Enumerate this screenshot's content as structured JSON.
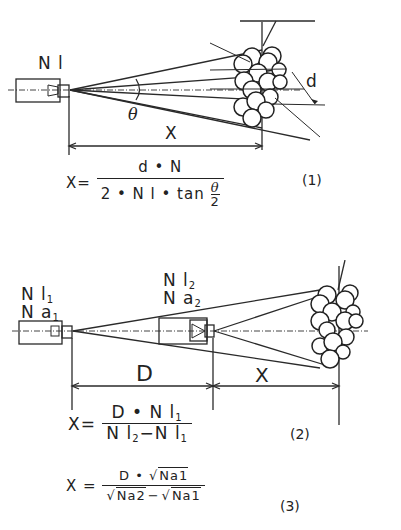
{
  "figure1": {
    "camera_label": "N l",
    "angle_label": "θ",
    "distance_label": "X",
    "diameter_label": "d",
    "equation": {
      "lhs": "X=",
      "numerator": "d • N",
      "denominator_prefix": "2 • N l • tan ",
      "theta": "θ",
      "two": "2",
      "number": "(1)"
    }
  },
  "figure2": {
    "camera1_label_line1": "N l",
    "camera1_label_line1_sub": "1",
    "camera1_label_line2": "N a",
    "camera1_label_line2_sub": "1",
    "camera2_label_line1": "N l",
    "camera2_label_line1_sub": "2",
    "camera2_label_line2": "N a",
    "camera2_label_line2_sub": "2",
    "baseline_label": "D",
    "distance_label": "X",
    "equation2": {
      "lhs": "X=",
      "numerator": "D • N l",
      "numerator_sub": "1",
      "denominator_a": "N l",
      "denominator_a_sub": "2",
      "minus": "−",
      "denominator_b": "N l",
      "denominator_b_sub": "1",
      "number": "(2)"
    },
    "equation3": {
      "lhs": "X =",
      "numerator_prefix": "D • ",
      "sqrt_sign": "√",
      "numerator_radicand": "Na1",
      "denominator_radicand_a": "Na2",
      "minus": "−",
      "denominator_radicand_b": "Na1",
      "number": "(3)"
    }
  }
}
